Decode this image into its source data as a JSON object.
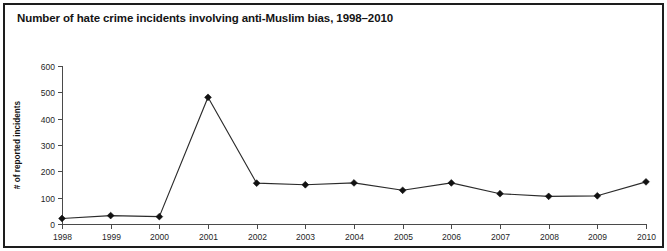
{
  "figure": {
    "title": "Number of hate crime incidents involving anti-Muslim bias, 1998–2010",
    "border_color": "#1d1d1d",
    "background_color": "#ffffff"
  },
  "chart_data": {
    "type": "line",
    "title": "Number of hate crime incidents involving anti-Muslim bias, 1998–2010",
    "xlabel": "",
    "ylabel": "# of reported incidents",
    "categories": [
      "1998",
      "1999",
      "2000",
      "2001",
      "2002",
      "2003",
      "2004",
      "2005",
      "2006",
      "2007",
      "2008",
      "2009",
      "2010"
    ],
    "values": [
      21,
      32,
      28,
      481,
      155,
      149,
      156,
      128,
      156,
      115,
      105,
      107,
      160
    ],
    "ylim": [
      0,
      600
    ],
    "ytick_values": [
      0,
      100,
      200,
      300,
      400,
      500,
      600
    ],
    "ytick_labels": [
      "0",
      "100",
      "200",
      "300",
      "400",
      "500",
      "600"
    ],
    "grid": false,
    "legend": null,
    "series_color": "#2b2b2b",
    "marker": "diamond",
    "marker_color": "#111111"
  }
}
